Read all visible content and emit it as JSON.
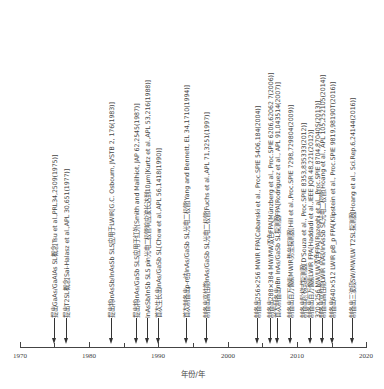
{
  "axis": {
    "title": "年份/年",
    "range": [
      1970,
      2020
    ],
    "major_ticks": [
      {
        "year": 1970,
        "label": "1970"
      },
      {
        "year": 1980,
        "label": "1980"
      },
      {
        "year": 1990,
        "label": "1990"
      },
      {
        "year": 2000,
        "label": "2000"
      },
      {
        "year": 2010,
        "label": "2010"
      },
      {
        "year": 2020,
        "label": "2020"
      }
    ],
    "minor_ticks": [
      1975,
      1985,
      1995,
      2005,
      2015
    ]
  },
  "events": [
    {
      "year": 1975,
      "label": "提出GaAs/GaAlAs SL概念[Tsu et al.,PRL34,2509(1975)]"
    },
    {
      "year": 1977,
      "label": "提出T2SL概念[Sai-Halasz et al.,APL 30,651(1977)]"
    },
    {
      "year": 1983,
      "label": "提出将InAsSb/InAsSb SLS应用于LWIR[G.C. Osbourn, JVSTB 2, 176(1983)]"
    },
    {
      "year": 1987,
      "label": "提出将InAs/GaSb SLS应用于红外[Smith and Mailhiot, JAP 62,2545(1987)]"
    },
    {
      "year": 1988,
      "label": "InAsSb/InSb SLS pin光电二极管响应波长达到10μm[Kurtz et al.,APL 53,216(1988)]"
    },
    {
      "year": 1990,
      "label": "首次生长出InAs/GaSb SL[Chow et al.,APL 56,1418(1990)]"
    },
    {
      "year": 1994,
      "label": "首次制备出p-n结InAs/GaSb SL光电二极管[Yang and Bennett, EL 34,1710(1994)]"
    },
    {
      "year": 1997,
      "label": "制备出高性能InAs/GaSb SL光电二极管[Fuchs et al.,APL 71,3251(1997)]"
    },
    {
      "year": 2004,
      "label": "制备出256×256 MWIR FPA[Cabanski et al., Proc.SPIE 5406,184(2004)]"
    },
    {
      "year": 2006,
      "label": "制备出288×384 MW/MW双色FPA[Münzberg et al., Proc.SPIE 6206,62062 7(2006)]"
    },
    {
      "year": 2007,
      "label": "首次制备出nBn InAs/GaSb SL探测器FPA[Rodriguez et al., APL 91,043514(2007)]"
    },
    {
      "year": 2009,
      "label": "制备出百万像素MWIR势垒探测器[Hill et al.,Proc.SPIE 7298,729804(2009)]"
    },
    {
      "year": 2012,
      "label": "制备出阶梯式探测器[D'Souza et al., Proc.SPIE 8353,835333(2012)]"
    },
    {
      "year": 2012,
      "label": "制备出百万像素LWIR FPA[Haddadi et al.,IEEE JQR 48,221(2012)]"
    },
    {
      "year": 2013,
      "label": "320×256 MW/LW双色FPA[Razeghi et al., Proc.SPIE 8704,87040S(2013)]"
    },
    {
      "year": 2014,
      "label": "制备出高性能LWIR InAs/InAsSb SL光电二极管[Hoang et al., APL 105,252105(2014)]"
    },
    {
      "year": 2016,
      "label": "制备出640×512 LWIR pB_p FPA[Klipstein et al., Proc.SPIE 9819,98190T(2016)]"
    },
    {
      "year": 2016,
      "label": "制备出三波段SW/MW/LW T2SL探测器[Hoang et al., Sci.Rep.6,24144(2016)]"
    }
  ],
  "colors": {
    "line": "#333333",
    "text": "#444444",
    "background": "#ffffff"
  }
}
